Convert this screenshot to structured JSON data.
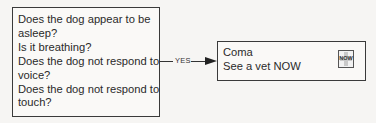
{
  "question_box": {
    "lines": [
      "Does the dog appear to be",
      "asleep?",
      "Is it breathing?",
      "Does the dog not respond to",
      "voice?",
      "Does the dog not respond to",
      "touch?"
    ]
  },
  "connector": {
    "label": "YES"
  },
  "result_box": {
    "title": "Coma",
    "action": "See a vet NOW",
    "icon": {
      "name": "now-urgent-icon",
      "label": "NOW"
    }
  }
}
